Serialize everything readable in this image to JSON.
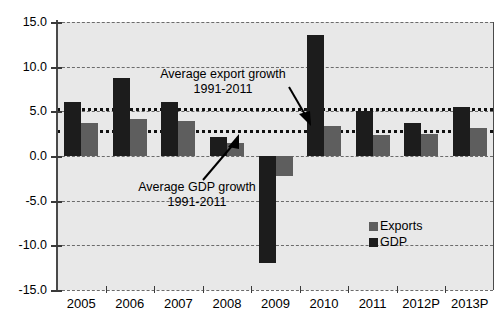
{
  "chart_data": {
    "type": "bar",
    "title": "",
    "subtitle": "",
    "xlabel": "",
    "ylabel": "",
    "categories": [
      "2005",
      "2006",
      "2007",
      "2008",
      "2009",
      "2010",
      "2011",
      "2012P",
      "2013P"
    ],
    "series": [
      {
        "name": "GDP",
        "color": "#1c1c1c",
        "values": [
          6.1,
          8.7,
          6.1,
          2.1,
          -12.0,
          13.6,
          5.0,
          3.7,
          5.5
        ]
      },
      {
        "name": "Exports",
        "color": "#5e5e5e",
        "values": [
          3.7,
          4.1,
          3.9,
          1.4,
          -2.2,
          3.4,
          2.4,
          2.5,
          3.1
        ]
      }
    ],
    "ylim": [
      -15.0,
      15.0
    ],
    "yticks": [
      15.0,
      10.0,
      5.0,
      0.0,
      -5.0,
      -10.0,
      -15.0
    ],
    "ytick_labels": [
      "15.0",
      "10.0",
      "5.0",
      "0.0",
      "-5.0",
      "-10.0",
      "-15.0"
    ],
    "grid": true,
    "grid_style": "dashed",
    "legend_position": "inside-right-lower",
    "reference_lines": [
      {
        "name": "average-export-growth",
        "label": "Average export growth",
        "label_line2": "1991-2011",
        "value": 5.4,
        "style": "thick-dotted",
        "color": "#111111"
      },
      {
        "name": "average-gdp-growth",
        "label": "Average GDP growth",
        "label_line2": "1991-2011",
        "value": 2.9,
        "style": "thick-dotted",
        "color": "#111111"
      }
    ],
    "annotations": [
      {
        "name": "average-export-growth-annotation",
        "line1": "Average export growth",
        "line2": "1991-2011",
        "arrow": "down-right"
      },
      {
        "name": "average-gdp-growth-annotation",
        "line1": "Average GDP growth",
        "line2": "1991-2011",
        "arrow": "up-right"
      }
    ],
    "legend": [
      {
        "label": "Exports",
        "color": "#5e5e5e"
      },
      {
        "label": "GDP",
        "color": "#1c1c1c"
      }
    ],
    "plot_background": "#e8e8e8"
  },
  "y_axis": {
    "ticks": [
      {
        "label": "15.0"
      },
      {
        "label": "10.0"
      },
      {
        "label": "5.0"
      },
      {
        "label": "0.0"
      },
      {
        "label": "-5.0"
      },
      {
        "label": "-10.0"
      },
      {
        "label": "-15.0"
      }
    ]
  },
  "x_axis": {
    "ticks": [
      {
        "label": "2005"
      },
      {
        "label": "2006"
      },
      {
        "label": "2007"
      },
      {
        "label": "2008"
      },
      {
        "label": "2009"
      },
      {
        "label": "2010"
      },
      {
        "label": "2011"
      },
      {
        "label": "2012P"
      },
      {
        "label": "2013P"
      }
    ]
  },
  "annotations": {
    "export": {
      "line1": "Average export growth",
      "line2": "1991-2011"
    },
    "gdp": {
      "line1": "Average GDP growth",
      "line2": "1991-2011"
    }
  },
  "legend": {
    "exports_label": "Exports",
    "gdp_label": "GDP"
  }
}
